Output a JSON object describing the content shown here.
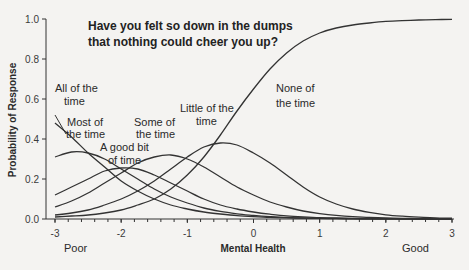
{
  "chart_data": {
    "type": "line",
    "title": "Have you felt so down in the dumps that nothing could cheer you up?",
    "title_lines": [
      "Have you felt so down in the dumps",
      "that nothing could cheer you up?"
    ],
    "xlabel": "Mental Health",
    "ylabel": "Probability of Response",
    "xlim": [
      -3,
      3
    ],
    "ylim": [
      0,
      1
    ],
    "x_ticks": [
      -3,
      -2,
      -1,
      0,
      1,
      2,
      3
    ],
    "x_tick_labels": [
      "-3",
      "-2",
      "-1",
      "0",
      "1",
      "2",
      "3"
    ],
    "y_ticks": [
      0,
      0.2,
      0.4,
      0.6,
      0.8,
      1.0
    ],
    "y_tick_labels": [
      "0.0",
      "0.2",
      "0.4",
      "0.6",
      "0.8",
      "1.0"
    ],
    "x_end_labels": {
      "left": "Poor",
      "right": "Good"
    },
    "grid": false,
    "legend": "none (inline annotations)",
    "x": [
      -3,
      -2.75,
      -2.5,
      -2.25,
      -2,
      -1.75,
      -1.5,
      -1.25,
      -1,
      -0.75,
      -0.5,
      -0.25,
      0,
      0.25,
      0.5,
      0.75,
      1,
      1.25,
      1.5,
      1.75,
      2,
      2.25,
      2.5,
      2.75,
      3
    ],
    "series": [
      {
        "name": "All of the time",
        "label_lines": [
          "All of the",
          "time"
        ],
        "values": [
          0.48,
          0.41,
          0.33,
          0.26,
          0.19,
          0.14,
          0.1,
          0.07,
          0.05,
          0.035,
          0.025,
          0.017,
          0.012,
          0.008,
          0.006,
          0.004,
          0.003,
          0.002,
          0.001,
          0.001,
          0.001,
          0.0,
          0.0,
          0.0,
          0.0
        ]
      },
      {
        "name": "Most of the time",
        "label_lines": [
          "Most of",
          "the time"
        ],
        "values": [
          0.31,
          0.335,
          0.33,
          0.3,
          0.25,
          0.2,
          0.15,
          0.11,
          0.08,
          0.055,
          0.038,
          0.026,
          0.018,
          0.012,
          0.008,
          0.005,
          0.004,
          0.003,
          0.002,
          0.001,
          0.001,
          0.001,
          0.0,
          0.0,
          0.0
        ]
      },
      {
        "name": "A good bit of time",
        "label_lines": [
          "A good bit",
          "of time"
        ],
        "values": [
          0.12,
          0.16,
          0.2,
          0.24,
          0.255,
          0.25,
          0.22,
          0.18,
          0.14,
          0.1,
          0.07,
          0.05,
          0.035,
          0.024,
          0.016,
          0.011,
          0.007,
          0.005,
          0.003,
          0.002,
          0.001,
          0.001,
          0.001,
          0.0,
          0.0
        ]
      },
      {
        "name": "Some of the time",
        "label_lines": [
          "Some of",
          "the time"
        ],
        "values": [
          0.06,
          0.09,
          0.13,
          0.18,
          0.23,
          0.28,
          0.31,
          0.32,
          0.3,
          0.26,
          0.21,
          0.16,
          0.12,
          0.085,
          0.06,
          0.04,
          0.027,
          0.018,
          0.012,
          0.008,
          0.005,
          0.003,
          0.002,
          0.001,
          0.001
        ]
      },
      {
        "name": "Little of the time",
        "label_lines": [
          "Little of the",
          "time"
        ],
        "values": [
          0.02,
          0.03,
          0.045,
          0.07,
          0.1,
          0.14,
          0.19,
          0.25,
          0.31,
          0.36,
          0.38,
          0.37,
          0.33,
          0.28,
          0.22,
          0.16,
          0.11,
          0.075,
          0.05,
          0.033,
          0.021,
          0.014,
          0.009,
          0.006,
          0.004
        ]
      },
      {
        "name": "None of the time",
        "label_lines": [
          "None of",
          "the time"
        ],
        "values": [
          0.01,
          0.015,
          0.02,
          0.03,
          0.045,
          0.07,
          0.1,
          0.15,
          0.22,
          0.31,
          0.42,
          0.54,
          0.65,
          0.75,
          0.83,
          0.89,
          0.93,
          0.955,
          0.97,
          0.98,
          0.988,
          0.992,
          0.995,
          0.997,
          0.998
        ]
      }
    ]
  }
}
